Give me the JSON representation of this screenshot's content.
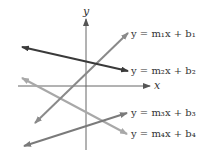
{
  "diagram": {
    "axes": {
      "x_label": "x",
      "y_label": "y"
    },
    "lines": [
      {
        "label": "y = m₁x + b₁",
        "color": "#8a8a8a"
      },
      {
        "label": "y = m₂x + b₂",
        "color": "#3a3a3a"
      },
      {
        "label": "y = m₃x + b₃",
        "color": "#7a7a7a"
      },
      {
        "label": "y = m₄x + b₄",
        "color": "#a8a8a8"
      }
    ]
  }
}
